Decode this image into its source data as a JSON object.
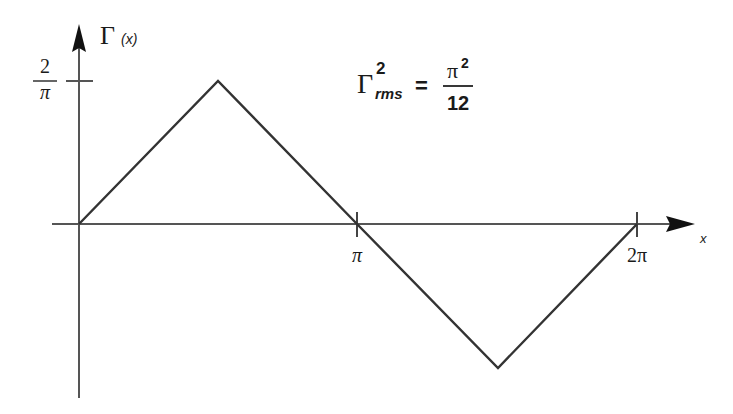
{
  "diagram": {
    "y_axis": {
      "label_symbol": "Γ",
      "label_arg": "(x)",
      "tick_label_num": "2",
      "tick_label_den": "π"
    },
    "x_axis": {
      "label": "x",
      "ticks": [
        {
          "label": "π"
        },
        {
          "label": "2π"
        }
      ]
    },
    "formula": {
      "lhs_symbol": "Γ",
      "lhs_sup": "2",
      "lhs_sub": "rms",
      "equals": "=",
      "rhs_num_base": "π",
      "rhs_num_sup": "2",
      "rhs_den": "12"
    },
    "waveform": {
      "type": "triangle",
      "points": [
        {
          "x": "0",
          "y": "0"
        },
        {
          "x": "π/2",
          "y": "2/π"
        },
        {
          "x": "π",
          "y": "0"
        },
        {
          "x": "3π/2",
          "y": "-2/π"
        },
        {
          "x": "2π",
          "y": "0"
        }
      ],
      "line_color": "#333333"
    }
  }
}
